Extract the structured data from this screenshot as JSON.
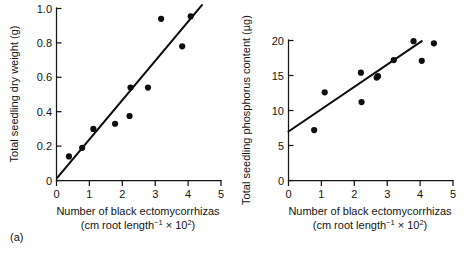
{
  "figure": {
    "panel_a_caption": "(a)",
    "panel_b_caption": "(b)"
  },
  "chart_data": [
    {
      "type": "scatter",
      "panel": "(a)",
      "title": "",
      "xlabel": "Number of black ectomycorrhizas",
      "xlabel_sub_prefix": "(cm root length",
      "xlabel_sub_sup1": "−1",
      "xlabel_sub_mid": " × 10",
      "xlabel_sub_sup2": "2",
      "xlabel_sub_suffix": ")",
      "ylabel": "Total seedling dry weight (g)",
      "xlim": [
        0,
        5
      ],
      "ylim": [
        0,
        1.0
      ],
      "xticks": [
        0,
        1,
        2,
        3,
        4,
        5
      ],
      "xtick_labels": [
        "0",
        "1",
        "2",
        "3",
        "4",
        "5"
      ],
      "yticks": [
        0,
        0.2,
        0.4,
        0.6,
        0.8,
        1.0
      ],
      "ytick_labels": [
        "0",
        "0.2",
        "0.4",
        "0.6",
        "0.8",
        "1.0"
      ],
      "grid": false,
      "legend": "none",
      "x": [
        0.38,
        0.78,
        1.12,
        1.78,
        2.22,
        2.25,
        2.78,
        3.18,
        3.82,
        4.08
      ],
      "y": [
        0.14,
        0.19,
        0.3,
        0.33,
        0.375,
        0.54,
        0.54,
        0.94,
        0.78,
        0.955
      ],
      "fit_line": {
        "label": "regression line",
        "x_start": 0.02,
        "y_start": 0.015,
        "x_end": 4.42,
        "y_end": 1.02
      }
    },
    {
      "type": "scatter",
      "panel": "(b)",
      "title": "",
      "xlabel": "Number of black ectomycorrhizas",
      "xlabel_sub_prefix": "(cm root length",
      "xlabel_sub_sup1": "−1",
      "xlabel_sub_mid": " × 10",
      "xlabel_sub_sup2": "2",
      "xlabel_sub_suffix": ")",
      "ylabel": "Total seedling phosphorus content (µg)",
      "xlim": [
        0,
        5
      ],
      "ylim": [
        0,
        20
      ],
      "xticks": [
        0,
        1,
        2,
        3,
        4,
        5
      ],
      "xtick_labels": [
        "0",
        "1",
        "2",
        "3",
        "4",
        "5"
      ],
      "yticks": [
        0,
        5,
        10,
        15,
        20
      ],
      "ytick_labels": [
        "0",
        "5",
        "10",
        "15",
        "20"
      ],
      "grid": false,
      "legend": "none",
      "x": [
        0.78,
        1.1,
        2.2,
        2.22,
        2.68,
        2.72,
        3.2,
        3.8,
        4.05,
        4.42
      ],
      "y": [
        7.2,
        12.6,
        15.4,
        11.2,
        14.7,
        14.9,
        17.2,
        19.9,
        17.1,
        19.6
      ],
      "fit_line": {
        "label": "regression line",
        "x_start": 0.0,
        "y_start": 7.0,
        "x_end": 4.05,
        "y_end": 19.9
      }
    }
  ]
}
